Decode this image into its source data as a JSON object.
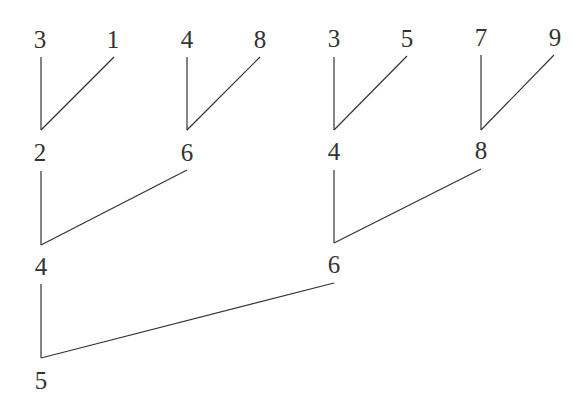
{
  "diagram": {
    "type": "tree",
    "colors": {
      "ink": "#333333",
      "background": "#ffffff"
    },
    "levels": [
      {
        "level": 1,
        "nodes": [
          "3",
          "1",
          "4",
          "8",
          "3",
          "5",
          "7",
          "9"
        ]
      },
      {
        "level": 2,
        "nodes": [
          "2",
          "6",
          "4",
          "8"
        ]
      },
      {
        "level": 3,
        "nodes": [
          "4",
          "6"
        ]
      },
      {
        "level": 4,
        "nodes": [
          "5"
        ]
      }
    ],
    "edges": [
      {
        "from": "L1-0 (3)",
        "to": "L2-0 (2)"
      },
      {
        "from": "L1-1 (1)",
        "to": "L2-0 (2)"
      },
      {
        "from": "L1-2 (4)",
        "to": "L2-1 (6)"
      },
      {
        "from": "L1-3 (8)",
        "to": "L2-1 (6)"
      },
      {
        "from": "L1-4 (3)",
        "to": "L2-2 (4)"
      },
      {
        "from": "L1-5 (5)",
        "to": "L2-2 (4)"
      },
      {
        "from": "L1-6 (7)",
        "to": "L2-3 (8)"
      },
      {
        "from": "L1-7 (9)",
        "to": "L2-3 (8)"
      },
      {
        "from": "L2-0 (2)",
        "to": "L3-0 (4)"
      },
      {
        "from": "L2-1 (6)",
        "to": "L3-0 (4)"
      },
      {
        "from": "L2-2 (4)",
        "to": "L3-1 (6)"
      },
      {
        "from": "L2-3 (8)",
        "to": "L3-1 (6)"
      },
      {
        "from": "L3-0 (4)",
        "to": "L4-0 (5)"
      },
      {
        "from": "L3-1 (6)",
        "to": "L4-0 (5)"
      }
    ]
  }
}
